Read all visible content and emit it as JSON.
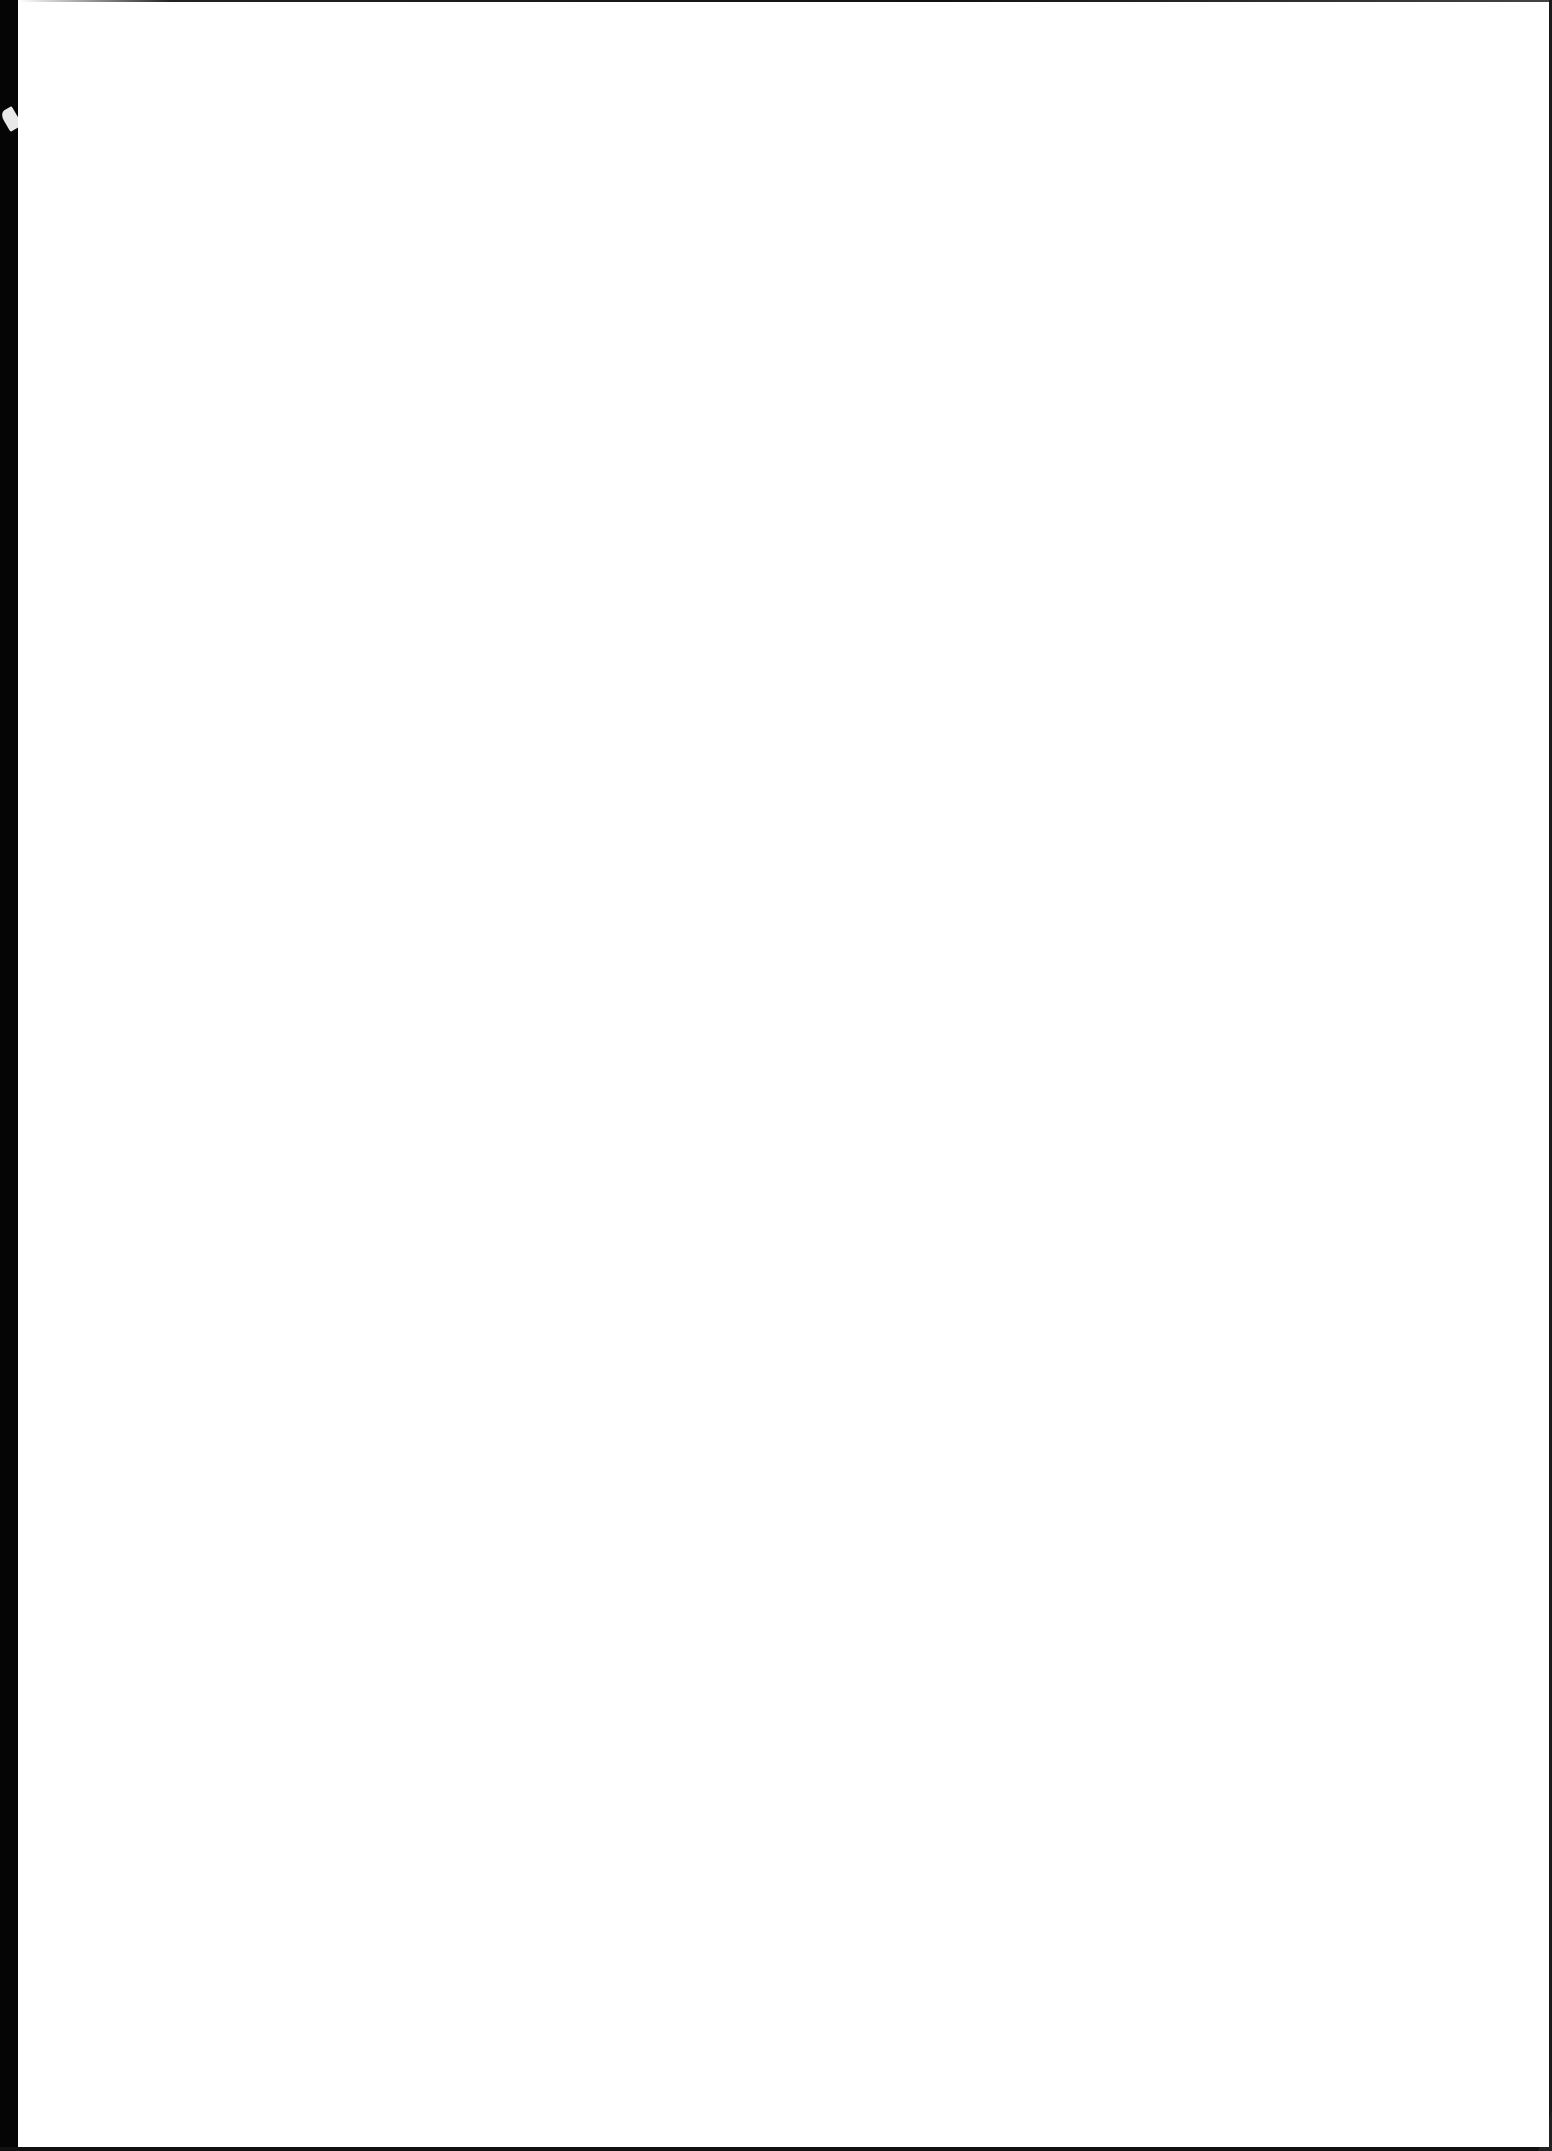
{
  "document": {
    "type": "scanned-page",
    "content": "",
    "blank": true
  },
  "colors": {
    "paper": "#ffffff",
    "scan_border": "#050505"
  }
}
